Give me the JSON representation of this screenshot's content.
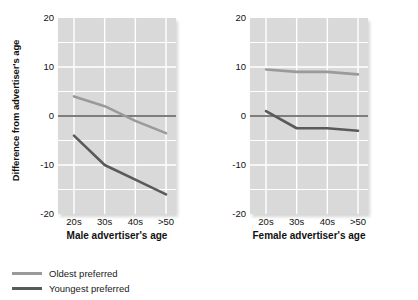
{
  "chart_data": {
    "type": "line",
    "title": "",
    "ylabel": "Difference from advertiser's age",
    "ylim": [
      -20,
      20
    ],
    "yticks": [
      20,
      10,
      0,
      -10,
      -20
    ],
    "ytick_labels": [
      "20",
      "10",
      "0",
      "-10",
      "-20"
    ],
    "categories": [
      "20s",
      "30s",
      "40s",
      ">50"
    ],
    "grid": true,
    "legend_position": "below",
    "legend": [
      {
        "name": "Oldest preferred",
        "color": "#9a9a9a"
      },
      {
        "name": "Youngest preferred",
        "color": "#5a5a5a"
      }
    ],
    "panels": [
      {
        "xlabel": "Male advertiser's age",
        "series": [
          {
            "name": "Oldest preferred",
            "color": "#9a9a9a",
            "values": [
              4,
              2,
              -1,
              -3.5
            ]
          },
          {
            "name": "Youngest preferred",
            "color": "#5a5a5a",
            "values": [
              -4,
              -10,
              -13,
              -16
            ]
          }
        ]
      },
      {
        "xlabel": "Female advertiser's age",
        "series": [
          {
            "name": "Oldest preferred",
            "color": "#9a9a9a",
            "values": [
              9.5,
              9,
              9,
              8.5
            ]
          },
          {
            "name": "Youngest preferred",
            "color": "#5a5a5a",
            "values": [
              1,
              -2.5,
              -2.5,
              -3
            ]
          }
        ]
      }
    ],
    "zero_line": 0,
    "colors": {
      "plot_background": "#d9d9d9",
      "gridline": "#ffffff",
      "zero_line": "#555555",
      "text": "#111111"
    }
  }
}
